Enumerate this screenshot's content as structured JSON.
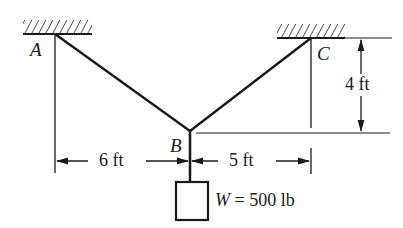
{
  "figure": {
    "name": "cable-support-free-body-diagram",
    "type": "statics-diagram",
    "background_color": "#ffffff",
    "line_color": "#1a1a1a"
  },
  "supports": [
    {
      "id": "A",
      "label": "A",
      "name": "support-a",
      "hatch_x_start": 23,
      "hatch_x_end": 92,
      "hatch_y": 34,
      "anchor_x": 55,
      "anchor_y": 34,
      "label_x": 30,
      "label_y": 40
    },
    {
      "id": "C",
      "label": "C",
      "name": "support-c",
      "hatch_x_start": 277,
      "hatch_x_end": 345,
      "hatch_y": 38,
      "anchor_x": 311,
      "anchor_y": 38,
      "label_x": 317,
      "label_y": 44
    }
  ],
  "joint": {
    "id": "B",
    "label": "B",
    "x": 190,
    "y": 131,
    "label_x": 170,
    "label_y": 136
  },
  "cables": [
    {
      "name": "cable-ab",
      "from": "A",
      "to": "B",
      "x1": 55,
      "y1": 34,
      "x2": 190,
      "y2": 131
    },
    {
      "name": "cable-cb",
      "from": "C",
      "to": "B",
      "x1": 311,
      "y1": 38,
      "x2": 190,
      "y2": 131
    },
    {
      "name": "cable-bw",
      "from": "B",
      "to": "W",
      "x1": 190,
      "y1": 131,
      "x2": 190,
      "y2": 182
    }
  ],
  "weight": {
    "label": "W = 500 lb",
    "symbol": "W",
    "equals": " = ",
    "value": "500 lb",
    "magnitude": 500,
    "unit": "lb",
    "box_x": 176,
    "box_y": 182,
    "box_w": 32,
    "box_h": 38,
    "label_x": 215,
    "label_y": 192
  },
  "dimensions": [
    {
      "name": "dim-6ft",
      "label": "6 ft",
      "value": 6,
      "unit": "ft",
      "orientation": "horizontal",
      "x1": 55,
      "x2": 190,
      "y": 161,
      "label_x": 99,
      "label_y": 152
    },
    {
      "name": "dim-5ft",
      "label": "5 ft",
      "value": 5,
      "unit": "ft",
      "orientation": "horizontal",
      "x1": 190,
      "x2": 311,
      "y": 161,
      "label_x": 228,
      "label_y": 152
    },
    {
      "name": "dim-4ft",
      "label": "4 ft",
      "value": 4,
      "unit": "ft",
      "orientation": "vertical",
      "x": 361,
      "y1": 38,
      "y2": 133,
      "label_x": 344,
      "label_y": 76
    }
  ],
  "reference_lines": [
    {
      "name": "extension-line-a",
      "x1": 55,
      "y1": 34,
      "x2": 55,
      "y2": 173
    },
    {
      "name": "extension-line-c",
      "x1": 311,
      "y1": 38,
      "x2": 311,
      "y2": 128
    },
    {
      "name": "extension-line-c-dim",
      "x1": 311,
      "y1": 148,
      "x2": 311,
      "y2": 173
    },
    {
      "name": "baseline-b",
      "x1": 196,
      "y1": 133,
      "x2": 390,
      "y2": 133
    },
    {
      "name": "top-reference-line",
      "x1": 345,
      "y1": 38,
      "x2": 392,
      "y2": 38
    },
    {
      "name": "extension-line-b",
      "x1": 190,
      "y1": 131,
      "x2": 190,
      "y2": 175
    }
  ]
}
